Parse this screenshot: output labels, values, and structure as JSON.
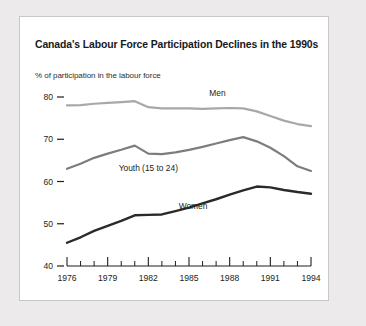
{
  "card": {
    "background": "#ffffff",
    "border_color": "#c9c6c6",
    "page_background": "#eceaea"
  },
  "title": "Canada's Labour Force Participation Declines in the 1990s",
  "subtitle": "% of participation in the labour force",
  "chart_data": {
    "type": "line",
    "title": "Canada's Labour Force Participation Declines in the 1990s",
    "subtitle": "% of participation in the labour force",
    "xlabel": "",
    "ylabel": "% of participation in the labour force",
    "xlim": [
      1976,
      1994
    ],
    "ylim": [
      40,
      80
    ],
    "grid": false,
    "legend": "inline-labels",
    "x": [
      1976,
      1977,
      1978,
      1979,
      1980,
      1981,
      1982,
      1983,
      1984,
      1985,
      1986,
      1987,
      1988,
      1989,
      1990,
      1991,
      1992,
      1993,
      1994
    ],
    "xticks_major": [
      1976,
      1979,
      1982,
      1985,
      1988,
      1991,
      1994
    ],
    "xtick_labels": [
      "1976",
      "1979",
      "1982",
      "1985",
      "1988",
      "1991",
      "1994"
    ],
    "yticks": [
      40,
      50,
      60,
      70,
      80
    ],
    "ytick_labels": [
      "40",
      "50",
      "60",
      "70",
      "80"
    ],
    "series": [
      {
        "name": "Men",
        "color": "#a8a8a8",
        "stroke_width": 2.2,
        "label_x": 1987.1,
        "label_y": 80.3,
        "values": [
          78.0,
          78.1,
          78.4,
          78.6,
          78.8,
          79.0,
          77.6,
          77.3,
          77.3,
          77.3,
          77.2,
          77.3,
          77.4,
          77.3,
          76.6,
          75.5,
          74.4,
          73.6,
          73.1
        ]
      },
      {
        "name": "Youth (15 to 24)",
        "color": "#7d7d7d",
        "stroke_width": 2.2,
        "label_x": 1982.0,
        "label_y": 62.4,
        "values": [
          63.0,
          64.2,
          65.6,
          66.6,
          67.5,
          68.5,
          66.6,
          66.5,
          66.9,
          67.5,
          68.2,
          69.0,
          69.8,
          70.5,
          69.5,
          68.0,
          66.0,
          63.6,
          62.5
        ]
      },
      {
        "name": "Women",
        "color": "#2a2a2a",
        "stroke_width": 2.4,
        "label_x": 1985.3,
        "label_y": 53.4,
        "values": [
          45.5,
          46.8,
          48.3,
          49.5,
          50.7,
          52.0,
          52.1,
          52.2,
          53.0,
          53.8,
          54.8,
          55.8,
          56.9,
          57.9,
          58.8,
          58.6,
          58.0,
          57.5,
          57.1
        ]
      }
    ]
  }
}
